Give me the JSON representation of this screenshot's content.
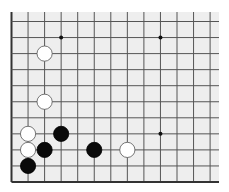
{
  "board": {
    "description": "Partial Go board (lower-left corner region), 13 vertical x 11 horizontal lines visible",
    "background_color": "#eeeeee",
    "line_color": "#555555",
    "edge_color": "#333333",
    "columns_visible": 13,
    "rows_visible": 11,
    "edges": [
      "left",
      "bottom"
    ],
    "star_points": [
      {
        "col": 3,
        "row": 1
      },
      {
        "col": 9,
        "row": 1
      },
      {
        "col": 9,
        "row": 7
      }
    ],
    "stones": [
      {
        "color": "white",
        "col": 2,
        "row": 2
      },
      {
        "color": "white",
        "col": 2,
        "row": 5
      },
      {
        "color": "white",
        "col": 1,
        "row": 7
      },
      {
        "color": "black",
        "col": 3,
        "row": 7
      },
      {
        "color": "white",
        "col": 1,
        "row": 8
      },
      {
        "color": "black",
        "col": 2,
        "row": 8
      },
      {
        "color": "black",
        "col": 5,
        "row": 8
      },
      {
        "color": "white",
        "col": 7,
        "row": 8
      },
      {
        "color": "black",
        "col": 1,
        "row": 9
      }
    ]
  }
}
